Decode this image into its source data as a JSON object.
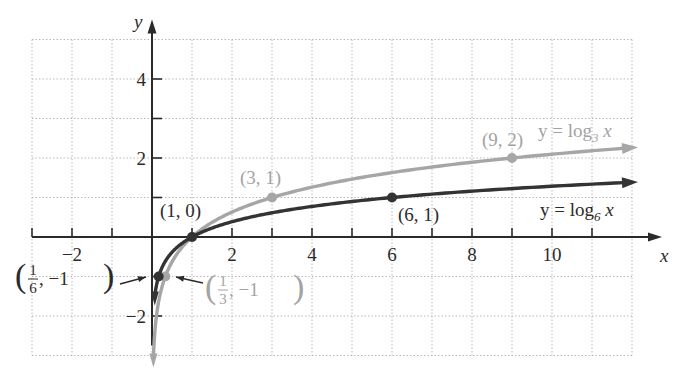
{
  "chart_data": {
    "type": "line",
    "title": "",
    "xlabel": "x",
    "ylabel": "y",
    "xlim": [
      -3,
      12
    ],
    "ylim": [
      -3,
      5
    ],
    "grid": true,
    "x_ticks": [
      -3,
      -2,
      -1,
      1,
      2,
      3,
      4,
      5,
      6,
      7,
      8,
      9,
      10,
      11
    ],
    "x_tick_labels": [
      {
        "value": -2,
        "label": "−2"
      },
      {
        "value": 2,
        "label": "2"
      },
      {
        "value": 4,
        "label": "4"
      },
      {
        "value": 6,
        "label": "6"
      },
      {
        "value": 8,
        "label": "8"
      },
      {
        "value": 10,
        "label": "10"
      }
    ],
    "y_ticks": [
      -2,
      -1,
      1,
      2,
      3,
      4
    ],
    "y_tick_labels": [
      {
        "value": 4,
        "label": "4"
      },
      {
        "value": 2,
        "label": "2"
      },
      {
        "value": -2,
        "label": "−2"
      }
    ],
    "series": [
      {
        "name": "y = log3 x",
        "label_prefix": "y = log",
        "label_sub": "3",
        "label_suffix": " x",
        "base": 3,
        "color": "#a6a6a6",
        "x_range": [
          0.035,
          11.8
        ],
        "points": [
          {
            "x": 0.3333,
            "y": -1,
            "label_kind": "fraction",
            "num": "1",
            "den": "3",
            "rest": ", −1"
          },
          {
            "x": 1,
            "y": 0
          },
          {
            "x": 3,
            "y": 1,
            "label": "(3, 1)"
          },
          {
            "x": 9,
            "y": 2,
            "label": "(9, 2)"
          }
        ]
      },
      {
        "name": "y = log6 x",
        "label_prefix": "y = log",
        "label_sub": "6",
        "label_suffix": " x",
        "base": 6,
        "color": "#333333",
        "x_range": [
          0.07,
          11.8
        ],
        "points": [
          {
            "x": 0.1667,
            "y": -1,
            "label_kind": "fraction",
            "num": "1",
            "den": "6",
            "rest": ", −1"
          },
          {
            "x": 1,
            "y": 0,
            "label": "(1, 0)"
          },
          {
            "x": 6,
            "y": 1,
            "label": "(6, 1)"
          }
        ]
      }
    ],
    "annotations": [
      {
        "text": "(1, 0)",
        "x": 1,
        "y": 0,
        "series": "both"
      },
      {
        "text": "(3, 1)",
        "x": 3,
        "y": 1
      },
      {
        "text": "(9, 2)",
        "x": 9,
        "y": 2
      },
      {
        "text": "(6, 1)",
        "x": 6,
        "y": 1
      },
      {
        "text": "(1/6, −1)",
        "x": 0.1667,
        "y": -1
      },
      {
        "text": "(1/3, −1)",
        "x": 0.3333,
        "y": -1
      }
    ]
  }
}
